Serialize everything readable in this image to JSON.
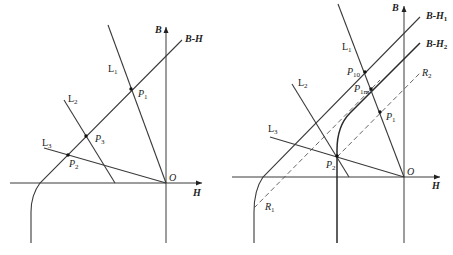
{
  "left_diagram": {
    "axes": {
      "x_label": "H",
      "y_label": "B",
      "origin_label": "O"
    },
    "curve_label": "B-H",
    "lines": [
      {
        "name": "L",
        "sub": "1"
      },
      {
        "name": "L",
        "sub": "2"
      },
      {
        "name": "L",
        "sub": "3"
      }
    ],
    "points": [
      {
        "name": "P",
        "sub": "1"
      },
      {
        "name": "P",
        "sub": "3"
      },
      {
        "name": "P",
        "sub": "2"
      }
    ]
  },
  "right_diagram": {
    "axes": {
      "x_label": "H",
      "y_label": "B",
      "origin_label": "O"
    },
    "curves": [
      {
        "name": "B-H",
        "sub": "1"
      },
      {
        "name": "B-H",
        "sub": "2"
      }
    ],
    "recoil_lines": [
      {
        "name": "R",
        "sub": "1"
      },
      {
        "name": "R",
        "sub": "2"
      }
    ],
    "lines": [
      {
        "name": "L",
        "sub": "1"
      },
      {
        "name": "L",
        "sub": "2"
      },
      {
        "name": "L",
        "sub": "3"
      }
    ],
    "points": [
      {
        "name": "P",
        "sub": "10"
      },
      {
        "name": "P",
        "sub": "1m"
      },
      {
        "name": "P",
        "sub": "1"
      },
      {
        "name": "P",
        "sub": "2"
      }
    ]
  }
}
